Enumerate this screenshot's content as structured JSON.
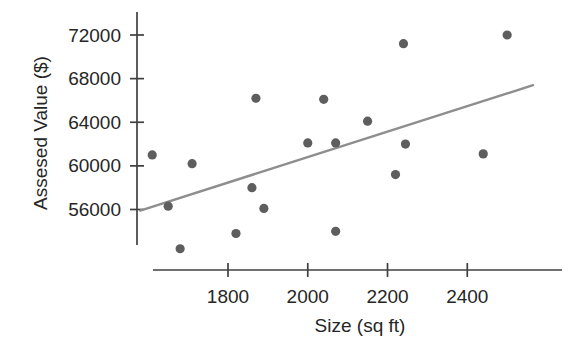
{
  "chart_data": {
    "type": "scatter",
    "title": "",
    "xlabel": "Size (sq ft)",
    "ylabel": "Assesed Value ($)",
    "x_ticks": [
      1800,
      2000,
      2200,
      2400
    ],
    "x_tick_labels": [
      "1800",
      "2000",
      "2200",
      "2400"
    ],
    "y_ticks": [
      72000,
      68000,
      64000,
      60000,
      56000
    ],
    "y_tick_labels": [
      "72000",
      "68000",
      "64000",
      "60000",
      "56000"
    ],
    "xlim": [
      1565,
      2640
    ],
    "ylim": [
      51200,
      73100
    ],
    "grid": false,
    "legend_position": "none",
    "points": [
      [
        1610,
        61000
      ],
      [
        1650,
        56300
      ],
      [
        1680,
        52400
      ],
      [
        1710,
        60200
      ],
      [
        1820,
        53800
      ],
      [
        1860,
        58000
      ],
      [
        1870,
        66200
      ],
      [
        1890,
        56100
      ],
      [
        2000,
        62100
      ],
      [
        2040,
        66100
      ],
      [
        2070,
        62100
      ],
      [
        2070,
        54000
      ],
      [
        2150,
        64100
      ],
      [
        2220,
        59200
      ],
      [
        2240,
        71200
      ],
      [
        2245,
        62000
      ],
      [
        2440,
        61100
      ],
      [
        2500,
        72000
      ]
    ],
    "trend_line": {
      "x1": 1580,
      "y1": 55900,
      "x2": 2565,
      "y2": 67400,
      "description": "fitted regression line, increasing"
    },
    "colors": {
      "point": "#5e5e5e",
      "trend": "#8e8e8e",
      "axis": "#404040",
      "text": "#262626",
      "background": "#ffffff"
    }
  }
}
